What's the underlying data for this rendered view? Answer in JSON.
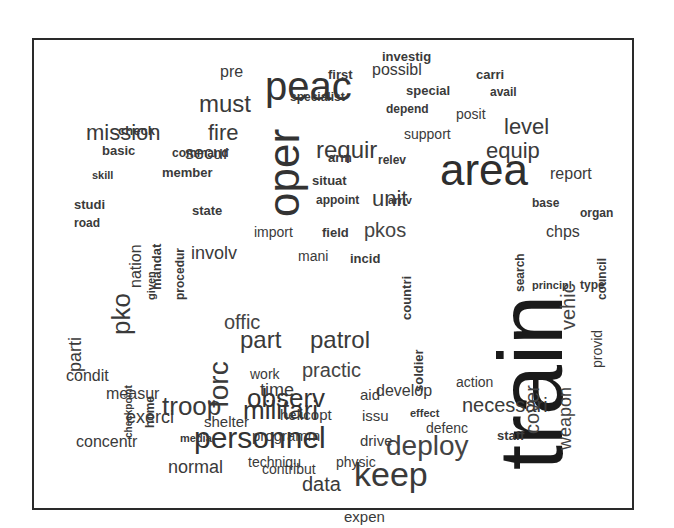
{
  "chart_data": {
    "type": "wordcloud",
    "title": "",
    "frame": true,
    "words": [
      {
        "text": "train",
        "size": 90,
        "weight": 10,
        "x": 486,
        "y": 470,
        "rotate": -90,
        "color": "#1a1a1a"
      },
      {
        "text": "peac",
        "size": 40,
        "weight": 7,
        "x": 265,
        "y": 102,
        "rotate": 0,
        "color": "#333333"
      },
      {
        "text": "area",
        "size": 44,
        "weight": 7,
        "x": 440,
        "y": 188,
        "rotate": 0,
        "color": "#2e2e2e"
      },
      {
        "text": "oper",
        "size": 44,
        "weight": 7,
        "x": 262,
        "y": 217,
        "rotate": -90,
        "color": "#333333"
      },
      {
        "text": "personnel",
        "size": 30,
        "weight": 6,
        "x": 194,
        "y": 450,
        "rotate": 0,
        "color": "#333333"
      },
      {
        "text": "keep",
        "size": 34,
        "weight": 6,
        "x": 354,
        "y": 488,
        "rotate": 0,
        "color": "#3a3a3a"
      },
      {
        "text": "deploy",
        "size": 28,
        "weight": 5,
        "x": 386,
        "y": 457,
        "rotate": 0,
        "color": "#444444"
      },
      {
        "text": "militari",
        "size": 26,
        "weight": 5,
        "x": 243,
        "y": 420,
        "rotate": 0,
        "color": "#333333"
      },
      {
        "text": "troop",
        "size": 26,
        "weight": 5,
        "x": 162,
        "y": 416,
        "rotate": 0,
        "color": "#3a3a3a"
      },
      {
        "text": "forc",
        "size": 28,
        "weight": 5,
        "x": 205,
        "y": 408,
        "rotate": -90,
        "color": "#3a3a3a"
      },
      {
        "text": "observ",
        "size": 26,
        "weight": 5,
        "x": 247,
        "y": 408,
        "rotate": 0,
        "color": "#333333"
      },
      {
        "text": "part",
        "size": 24,
        "weight": 4,
        "x": 240,
        "y": 350,
        "rotate": 0,
        "color": "#3a3a3a"
      },
      {
        "text": "patrol",
        "size": 24,
        "weight": 4,
        "x": 310,
        "y": 350,
        "rotate": 0,
        "color": "#3a3a3a"
      },
      {
        "text": "requir",
        "size": 24,
        "weight": 4,
        "x": 316,
        "y": 160,
        "rotate": 0,
        "color": "#3a3a3a"
      },
      {
        "text": "must",
        "size": 24,
        "weight": 4,
        "x": 199,
        "y": 114,
        "rotate": 0,
        "color": "#3a3a3a"
      },
      {
        "text": "mission",
        "size": 22,
        "weight": 4,
        "x": 86,
        "y": 142,
        "rotate": 0,
        "color": "#3a3a3a"
      },
      {
        "text": "fire",
        "size": 22,
        "weight": 4,
        "x": 208,
        "y": 142,
        "rotate": 0,
        "color": "#3a3a3a"
      },
      {
        "text": "level",
        "size": 22,
        "weight": 4,
        "x": 504,
        "y": 136,
        "rotate": 0,
        "color": "#3a3a3a"
      },
      {
        "text": "equip",
        "size": 22,
        "weight": 4,
        "x": 486,
        "y": 160,
        "rotate": 0,
        "color": "#3a3a3a"
      },
      {
        "text": "unit",
        "size": 22,
        "weight": 4,
        "x": 372,
        "y": 208,
        "rotate": 0,
        "color": "#3a3a3a"
      },
      {
        "text": "pko",
        "size": 26,
        "weight": 4,
        "x": 108,
        "y": 335,
        "rotate": -90,
        "color": "#3a3a3a"
      },
      {
        "text": "pkos",
        "size": 20,
        "weight": 3,
        "x": 364,
        "y": 238,
        "rotate": 0,
        "color": "#444444"
      },
      {
        "text": "vehic",
        "size": 20,
        "weight": 3,
        "x": 558,
        "y": 330,
        "rotate": -90,
        "color": "#444444"
      },
      {
        "text": "cover",
        "size": 20,
        "weight": 3,
        "x": 522,
        "y": 434,
        "rotate": -90,
        "color": "#444444"
      },
      {
        "text": "weapon",
        "size": 18,
        "weight": 3,
        "x": 556,
        "y": 450,
        "rotate": -90,
        "color": "#444444"
      },
      {
        "text": "necessari",
        "size": 20,
        "weight": 3,
        "x": 462,
        "y": 413,
        "rotate": 0,
        "color": "#3a3a3a"
      },
      {
        "text": "offic",
        "size": 20,
        "weight": 3,
        "x": 224,
        "y": 330,
        "rotate": 0,
        "color": "#444444"
      },
      {
        "text": "practic",
        "size": 20,
        "weight": 3,
        "x": 302,
        "y": 378,
        "rotate": 0,
        "color": "#444444"
      },
      {
        "text": "data",
        "size": 20,
        "weight": 3,
        "x": 302,
        "y": 492,
        "rotate": 0,
        "color": "#3a3a3a"
      },
      {
        "text": "time",
        "size": 18,
        "weight": 3,
        "x": 260,
        "y": 397,
        "rotate": 0,
        "color": "#3a3a3a"
      },
      {
        "text": "exerci",
        "size": 18,
        "weight": 3,
        "x": 126,
        "y": 424,
        "rotate": 0,
        "color": "#3a3a3a"
      },
      {
        "text": "normal",
        "size": 18,
        "weight": 3,
        "x": 168,
        "y": 474,
        "rotate": 0,
        "color": "#3a3a3a"
      },
      {
        "text": "secur",
        "size": 18,
        "weight": 3,
        "x": 185,
        "y": 160,
        "rotate": 0,
        "color": "#3a3a3a"
      },
      {
        "text": "involv",
        "size": 18,
        "weight": 3,
        "x": 191,
        "y": 260,
        "rotate": 0,
        "color": "#3a3a3a"
      },
      {
        "text": "report",
        "size": 16,
        "weight": 3,
        "x": 550,
        "y": 180,
        "rotate": 0,
        "color": "#3a3a3a"
      },
      {
        "text": "develop",
        "size": 16,
        "weight": 3,
        "x": 376,
        "y": 397,
        "rotate": 0,
        "color": "#3a3a3a"
      },
      {
        "text": "concentr",
        "size": 16,
        "weight": 3,
        "x": 76,
        "y": 448,
        "rotate": 0,
        "color": "#3a3a3a"
      },
      {
        "text": "measur",
        "size": 16,
        "weight": 3,
        "x": 106,
        "y": 400,
        "rotate": 0,
        "color": "#3a3a3a"
      },
      {
        "text": "condit",
        "size": 16,
        "weight": 3,
        "x": 66,
        "y": 382,
        "rotate": 0,
        "color": "#3a3a3a"
      },
      {
        "text": "parti",
        "size": 18,
        "weight": 3,
        "x": 66,
        "y": 372,
        "rotate": -90,
        "color": "#3a3a3a"
      },
      {
        "text": "nation",
        "size": 16,
        "weight": 3,
        "x": 128,
        "y": 288,
        "rotate": -90,
        "color": "#3a3a3a"
      },
      {
        "text": "pre",
        "size": 16,
        "weight": 3,
        "x": 220,
        "y": 78,
        "rotate": 0,
        "color": "#3a3a3a"
      },
      {
        "text": "possibl",
        "size": 16,
        "weight": 3,
        "x": 372,
        "y": 76,
        "rotate": 0,
        "color": "#3a3a3a"
      },
      {
        "text": "chps",
        "size": 16,
        "weight": 3,
        "x": 546,
        "y": 238,
        "rotate": 0,
        "color": "#3a3a3a"
      },
      {
        "text": "shelter",
        "size": 15,
        "weight": 2,
        "x": 204,
        "y": 427,
        "rotate": 0,
        "color": "#3a3a3a"
      },
      {
        "text": "helicopt",
        "size": 15,
        "weight": 2,
        "x": 280,
        "y": 420,
        "rotate": 0,
        "color": "#3a3a3a"
      },
      {
        "text": "programm",
        "size": 15,
        "weight": 2,
        "x": 252,
        "y": 441,
        "rotate": 0,
        "color": "#3a3a3a"
      },
      {
        "text": "drive",
        "size": 15,
        "weight": 2,
        "x": 360,
        "y": 446,
        "rotate": 0,
        "color": "#3a3a3a"
      },
      {
        "text": "issu",
        "size": 15,
        "weight": 2,
        "x": 362,
        "y": 421,
        "rotate": 0,
        "color": "#3a3a3a"
      },
      {
        "text": "aid",
        "size": 15,
        "weight": 2,
        "x": 360,
        "y": 400,
        "rotate": 0,
        "color": "#3a3a3a"
      },
      {
        "text": "techniqu",
        "size": 14,
        "weight": 2,
        "x": 248,
        "y": 468,
        "rotate": 0,
        "color": "#3a3a3a"
      },
      {
        "text": "physic",
        "size": 14,
        "weight": 2,
        "x": 336,
        "y": 468,
        "rotate": 0,
        "color": "#3a3a3a"
      },
      {
        "text": "expen",
        "size": 15,
        "weight": 2,
        "x": 344,
        "y": 522,
        "rotate": 0,
        "color": "#3a3a3a"
      },
      {
        "text": "action",
        "size": 14,
        "weight": 2,
        "x": 456,
        "y": 388,
        "rotate": 0,
        "color": "#3a3a3a"
      },
      {
        "text": "defenc",
        "size": 14,
        "weight": 2,
        "x": 426,
        "y": 434,
        "rotate": 0,
        "color": "#3a3a3a"
      },
      {
        "text": "staff",
        "size": 13,
        "weight": 2,
        "x": 497,
        "y": 441,
        "rotate": 0,
        "color": "#3a3a3a"
      },
      {
        "text": "contribut",
        "size": 14,
        "weight": 2,
        "x": 262,
        "y": 475,
        "rotate": 0,
        "color": "#3a3a3a"
      },
      {
        "text": "work",
        "size": 14,
        "weight": 2,
        "x": 250,
        "y": 380,
        "rotate": 0,
        "color": "#3a3a3a"
      },
      {
        "text": "import",
        "size": 14,
        "weight": 2,
        "x": 254,
        "y": 238,
        "rotate": 0,
        "color": "#3a3a3a"
      },
      {
        "text": "field",
        "size": 13,
        "weight": 2,
        "x": 322,
        "y": 238,
        "rotate": 0,
        "color": "#3a3a3a"
      },
      {
        "text": "mani",
        "size": 14,
        "weight": 2,
        "x": 298,
        "y": 262,
        "rotate": 0,
        "color": "#3a3a3a"
      },
      {
        "text": "incid",
        "size": 13,
        "weight": 2,
        "x": 350,
        "y": 264,
        "rotate": 0,
        "color": "#3a3a3a"
      },
      {
        "text": "countri",
        "size": 13,
        "weight": 2,
        "x": 400,
        "y": 320,
        "rotate": -90,
        "color": "#3a3a3a"
      },
      {
        "text": "soldier",
        "size": 13,
        "weight": 2,
        "x": 412,
        "y": 392,
        "rotate": -90,
        "color": "#3a3a3a"
      },
      {
        "text": "search",
        "size": 12,
        "weight": 2,
        "x": 514,
        "y": 292,
        "rotate": -90,
        "color": "#3a3a3a"
      },
      {
        "text": "council",
        "size": 12,
        "weight": 2,
        "x": 596,
        "y": 300,
        "rotate": -90,
        "color": "#3a3a3a"
      },
      {
        "text": "provid",
        "size": 14,
        "weight": 2,
        "x": 590,
        "y": 368,
        "rotate": -90,
        "color": "#3a3a3a"
      },
      {
        "text": "organ",
        "size": 12,
        "weight": 2,
        "x": 580,
        "y": 218,
        "rotate": 0,
        "color": "#3a3a3a"
      },
      {
        "text": "base",
        "size": 12,
        "weight": 2,
        "x": 532,
        "y": 208,
        "rotate": 0,
        "color": "#3a3a3a"
      },
      {
        "text": "principl",
        "size": 11,
        "weight": 2,
        "x": 532,
        "y": 290,
        "rotate": 0,
        "color": "#3a3a3a"
      },
      {
        "text": "type",
        "size": 12,
        "weight": 2,
        "x": 580,
        "y": 290,
        "rotate": 0,
        "color": "#3a3a3a"
      },
      {
        "text": "effect",
        "size": 11,
        "weight": 2,
        "x": 410,
        "y": 418,
        "rotate": 0,
        "color": "#3a3a3a"
      },
      {
        "text": "investig",
        "size": 13,
        "weight": 2,
        "x": 382,
        "y": 62,
        "rotate": 0,
        "color": "#3a3a3a"
      },
      {
        "text": "first",
        "size": 13,
        "weight": 2,
        "x": 328,
        "y": 80,
        "rotate": 0,
        "color": "#3a3a3a"
      },
      {
        "text": "carri",
        "size": 13,
        "weight": 2,
        "x": 476,
        "y": 80,
        "rotate": 0,
        "color": "#3a3a3a"
      },
      {
        "text": "specialist",
        "size": 12,
        "weight": 2,
        "x": 290,
        "y": 102,
        "rotate": 0,
        "color": "#3a3a3a"
      },
      {
        "text": "special",
        "size": 13,
        "weight": 2,
        "x": 406,
        "y": 96,
        "rotate": 0,
        "color": "#3a3a3a"
      },
      {
        "text": "avail",
        "size": 12,
        "weight": 2,
        "x": 490,
        "y": 97,
        "rotate": 0,
        "color": "#3a3a3a"
      },
      {
        "text": "depend",
        "size": 12,
        "weight": 2,
        "x": 386,
        "y": 114,
        "rotate": 0,
        "color": "#3a3a3a"
      },
      {
        "text": "posit",
        "size": 14,
        "weight": 2,
        "x": 456,
        "y": 120,
        "rotate": 0,
        "color": "#3a3a3a"
      },
      {
        "text": "support",
        "size": 14,
        "weight": 2,
        "x": 404,
        "y": 140,
        "rotate": 0,
        "color": "#3a3a3a"
      },
      {
        "text": "arm",
        "size": 13,
        "weight": 2,
        "x": 328,
        "y": 163,
        "rotate": 0,
        "color": "#3a3a3a"
      },
      {
        "text": "relev",
        "size": 12,
        "weight": 2,
        "x": 378,
        "y": 165,
        "rotate": 0,
        "color": "#3a3a3a"
      },
      {
        "text": "situat",
        "size": 13,
        "weight": 2,
        "x": 312,
        "y": 186,
        "rotate": 0,
        "color": "#3a3a3a"
      },
      {
        "text": "appoint",
        "size": 12,
        "weight": 2,
        "x": 316,
        "y": 205,
        "rotate": 0,
        "color": "#3a3a3a"
      },
      {
        "text": "arriv",
        "size": 11,
        "weight": 2,
        "x": 388,
        "y": 205,
        "rotate": 0,
        "color": "#3a3a3a"
      },
      {
        "text": "check",
        "size": 13,
        "weight": 2,
        "x": 118,
        "y": 136,
        "rotate": 0,
        "color": "#3a3a3a"
      },
      {
        "text": "basic",
        "size": 13,
        "weight": 2,
        "x": 102,
        "y": 156,
        "rotate": 0,
        "color": "#3a3a3a"
      },
      {
        "text": "command",
        "size": 12,
        "weight": 2,
        "x": 172,
        "y": 158,
        "rotate": 0,
        "color": "#3a3a3a"
      },
      {
        "text": "skill",
        "size": 11,
        "weight": 2,
        "x": 92,
        "y": 180,
        "rotate": 0,
        "color": "#3a3a3a"
      },
      {
        "text": "member",
        "size": 13,
        "weight": 2,
        "x": 162,
        "y": 178,
        "rotate": 0,
        "color": "#3a3a3a"
      },
      {
        "text": "studi",
        "size": 13,
        "weight": 2,
        "x": 74,
        "y": 210,
        "rotate": 0,
        "color": "#3a3a3a"
      },
      {
        "text": "road",
        "size": 12,
        "weight": 2,
        "x": 74,
        "y": 228,
        "rotate": 0,
        "color": "#3a3a3a"
      },
      {
        "text": "state",
        "size": 13,
        "weight": 2,
        "x": 192,
        "y": 216,
        "rotate": 0,
        "color": "#3a3a3a"
      },
      {
        "text": "mandat",
        "size": 13,
        "weight": 2,
        "x": 150,
        "y": 290,
        "rotate": -90,
        "color": "#3a3a3a"
      },
      {
        "text": "given",
        "size": 11,
        "weight": 2,
        "x": 146,
        "y": 300,
        "rotate": -90,
        "color": "#3a3a3a"
      },
      {
        "text": "procedur",
        "size": 12,
        "weight": 2,
        "x": 174,
        "y": 300,
        "rotate": -90,
        "color": "#3a3a3a"
      },
      {
        "text": "media",
        "size": 11,
        "weight": 2,
        "x": 180,
        "y": 443,
        "rotate": 0,
        "color": "#3a3a3a"
      },
      {
        "text": "home",
        "size": 12,
        "weight": 2,
        "x": 144,
        "y": 428,
        "rotate": -90,
        "color": "#3a3a3a"
      },
      {
        "text": "checkpoint",
        "size": 10,
        "weight": 1,
        "x": 124,
        "y": 438,
        "rotate": -90,
        "color": "#3a3a3a"
      }
    ]
  }
}
